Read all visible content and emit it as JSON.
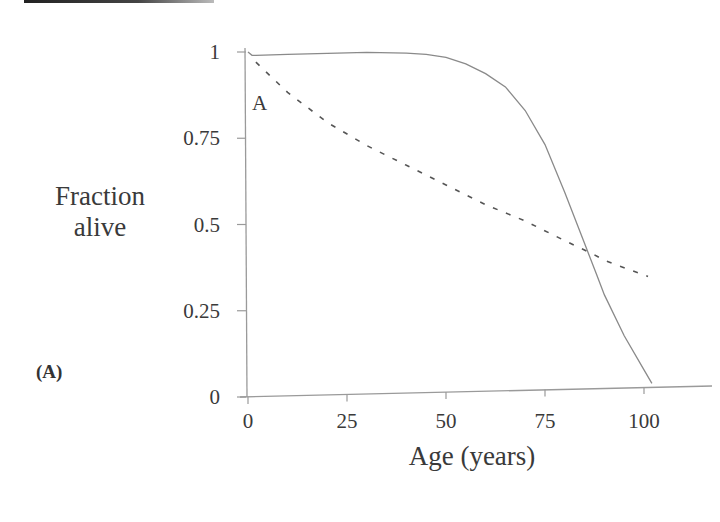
{
  "chart_data": {
    "type": "line",
    "title": "",
    "panel_label": "(A)",
    "xlabel": "Age (years)",
    "ylabel_lines": [
      "Fraction",
      "alive"
    ],
    "xlim": [
      0,
      110
    ],
    "ylim": [
      0,
      1
    ],
    "x_ticks": [
      0,
      25,
      50,
      75,
      100
    ],
    "x_tick_labels": [
      "0",
      "25",
      "50",
      "75",
      "100"
    ],
    "y_ticks": [
      0,
      0.25,
      0.5,
      0.75,
      1
    ],
    "y_tick_labels": [
      "0",
      "0.25",
      "0.5",
      "0.75",
      "1"
    ],
    "grid": false,
    "legend": null,
    "annotations": [
      {
        "text": "A",
        "x": 3,
        "y": 0.9
      }
    ],
    "series": [
      {
        "name": "solid",
        "style": "solid",
        "x": [
          0,
          1,
          2,
          10,
          20,
          30,
          40,
          45,
          50,
          55,
          60,
          65,
          70,
          75,
          80,
          85,
          88,
          90,
          95,
          100,
          102
        ],
        "y": [
          1.0,
          0.99,
          0.99,
          0.99,
          0.99,
          0.99,
          0.985,
          0.98,
          0.97,
          0.95,
          0.92,
          0.88,
          0.81,
          0.71,
          0.57,
          0.42,
          0.33,
          0.27,
          0.15,
          0.05,
          0.01
        ]
      },
      {
        "name": "dashed",
        "style": "dashed",
        "x": [
          2,
          10,
          20,
          30,
          40,
          50,
          60,
          70,
          80,
          87,
          90,
          101
        ],
        "y": [
          0.97,
          0.88,
          0.79,
          0.72,
          0.66,
          0.6,
          0.54,
          0.49,
          0.43,
          0.39,
          0.37,
          0.32
        ]
      }
    ]
  }
}
